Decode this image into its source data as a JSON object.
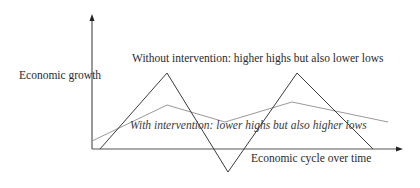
{
  "chart_data": {
    "type": "line",
    "title": "",
    "xlabel": "Economic cycle over time",
    "ylabel": "Economic growth",
    "grid": false,
    "legend": null,
    "annotations": [
      "Without intervention: higher highs but also lower lows",
      "With intervention: lower highs but also higher lows"
    ],
    "x": [
      0,
      1,
      2,
      3,
      4
    ],
    "series": [
      {
        "name": "Without intervention",
        "style": "dark solid",
        "color": "#3c3c3c",
        "values": [
          0,
          1,
          -0.3,
          1,
          0
        ]
      },
      {
        "name": "With intervention",
        "style": "light solid",
        "color": "#9a9a9a",
        "values": [
          0.1,
          0.58,
          0.36,
          0.61,
          0.36
        ]
      }
    ],
    "pixel_points": {
      "without_intervention": [
        [
          100,
          149
        ],
        [
          167,
          73
        ],
        [
          228,
          172
        ],
        [
          297,
          73
        ],
        [
          373,
          149
        ]
      ],
      "with_intervention": [
        [
          92,
          141
        ],
        [
          167,
          105
        ],
        [
          225,
          122
        ],
        [
          292,
          102
        ],
        [
          388,
          122
        ]
      ]
    }
  },
  "labels": {
    "ylabel": "Economic growth",
    "xlabel": "Economic cycle over time",
    "annot_without": "Without intervention: higher highs but also lower lows",
    "annot_with": "With intervention: lower highs but also higher lows"
  },
  "colors": {
    "axis": "#555555",
    "dark_line": "#3c3c3c",
    "light_line": "#9a9a9a"
  }
}
